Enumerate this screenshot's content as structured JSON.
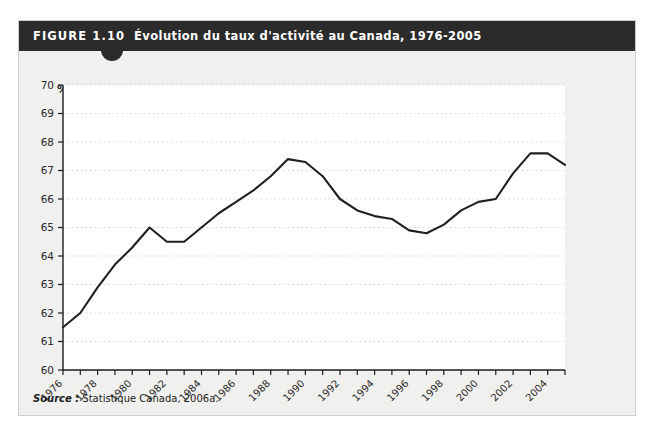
{
  "figure": {
    "number": "FIGURE 1.10",
    "title": "Évolution du taux d'activité au Canada, 1976-2005",
    "source_label": "Source :",
    "source_text": "Statistique Canada, 2006a.",
    "unit_label": "%",
    "header_color": "#2b2b2b",
    "card_color": "#f0f0ee",
    "line_color": "#231f20"
  },
  "chart_data": {
    "type": "line",
    "title": "Évolution du taux d'activité au Canada, 1976-2005",
    "xlabel": "",
    "ylabel": "%",
    "ylim": [
      60,
      70
    ],
    "xlim": [
      1976,
      2005
    ],
    "grid": true,
    "legend": "none",
    "yticks": [
      60,
      61,
      62,
      63,
      64,
      65,
      66,
      67,
      68,
      69,
      70
    ],
    "ytick_labels": [
      "60",
      "61",
      "62",
      "63",
      "64",
      "65",
      "66",
      "67",
      "68",
      "69",
      "70"
    ],
    "xticks": [
      1976,
      1978,
      1980,
      1982,
      1984,
      1986,
      1988,
      1990,
      1992,
      1994,
      1996,
      1998,
      2000,
      2002,
      2004
    ],
    "xtick_labels": [
      "1976",
      "1978",
      "1980",
      "1982",
      "1984",
      "1986",
      "1988",
      "1990",
      "1992",
      "1994",
      "1996",
      "1998",
      "2000",
      "2002",
      "2004"
    ],
    "x": [
      1976,
      1977,
      1978,
      1979,
      1980,
      1981,
      1982,
      1983,
      1984,
      1985,
      1986,
      1987,
      1988,
      1989,
      1990,
      1991,
      1992,
      1993,
      1994,
      1995,
      1996,
      1997,
      1998,
      1999,
      2000,
      2001,
      2002,
      2003,
      2004,
      2005
    ],
    "series": [
      {
        "name": "Taux d'activité",
        "values": [
          61.5,
          62.0,
          62.9,
          63.7,
          64.3,
          65.0,
          64.5,
          64.5,
          65.0,
          65.5,
          65.9,
          66.3,
          66.8,
          67.4,
          67.3,
          66.8,
          66.0,
          65.6,
          65.4,
          65.3,
          64.9,
          64.8,
          65.1,
          65.6,
          65.9,
          66.0,
          66.9,
          67.6,
          67.6,
          67.2
        ]
      }
    ]
  }
}
